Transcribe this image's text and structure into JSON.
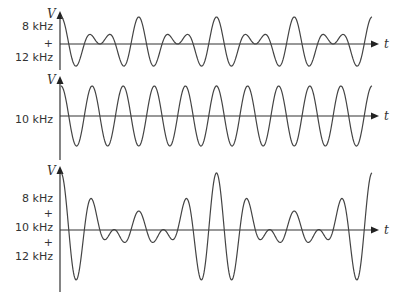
{
  "figure": {
    "title": "",
    "colors": {
      "axis": "#333333",
      "wave": "#444444",
      "text": "#333333",
      "background": "#ffffff"
    },
    "x_axis_label": "t",
    "y_axis_label": "V",
    "time_span_ms": 1.0,
    "panels": [
      {
        "id": "beat-8-12",
        "label_lines": [
          "8 kHz",
          "+",
          "12 kHz"
        ],
        "components_khz": [
          8,
          12
        ],
        "description": "Sum of 8 kHz and 12 kHz sinusoids (beat pattern)"
      },
      {
        "id": "pure-10",
        "label_lines": [
          "10 kHz"
        ],
        "components_khz": [
          10
        ],
        "description": "Pure 10 kHz sinusoid"
      },
      {
        "id": "sum-8-10-12",
        "label_lines": [
          "8 kHz",
          "+",
          "10 kHz",
          "+",
          "12 kHz"
        ],
        "components_khz": [
          8,
          10,
          12
        ],
        "description": "Sum of 8 kHz, 10 kHz and 12 kHz sinusoids"
      }
    ]
  }
}
